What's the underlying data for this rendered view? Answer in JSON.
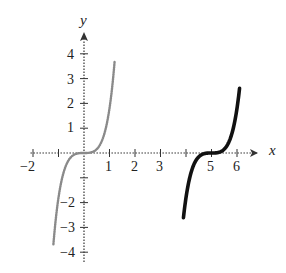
{
  "chart_data": {
    "type": "line",
    "title": "",
    "xlabel": "x",
    "ylabel": "y",
    "xlim": [
      -2.1,
      6.9
    ],
    "ylim": [
      -4.5,
      5.0
    ],
    "grid": false,
    "x_ticks": [
      -2,
      -1,
      1,
      2,
      3,
      4,
      5,
      6
    ],
    "x_tick_labels": [
      "-2",
      "",
      "1",
      "2",
      "3",
      "",
      "5",
      "6"
    ],
    "y_ticks": [
      4,
      3,
      2,
      1,
      -1,
      -2,
      -3,
      -4
    ],
    "y_tick_labels": [
      "4",
      "3",
      "2",
      "1",
      "",
      "-2",
      "-3",
      "-4"
    ],
    "series": [
      {
        "name": "parent cubic (gray dotted)",
        "style": "dotted",
        "color": "#8a8a8a",
        "center": [
          0,
          0
        ],
        "x_range": [
          -1.2,
          1.2
        ],
        "points": [
          [
            -1.2,
            -4.4
          ],
          [
            -1.0,
            -2.6
          ],
          [
            -0.8,
            -1.1
          ],
          [
            -0.6,
            -0.3
          ],
          [
            -0.3,
            -0.05
          ],
          [
            0,
            0
          ],
          [
            0.3,
            0.05
          ],
          [
            0.6,
            0.3
          ],
          [
            0.8,
            1.1
          ],
          [
            1.0,
            2.6
          ],
          [
            1.2,
            4.5
          ]
        ]
      },
      {
        "name": "translated cubic (black solid)",
        "style": "solid",
        "color": "#111111",
        "center": [
          5,
          0
        ],
        "x_range": [
          3.9,
          6.1
        ],
        "points": [
          [
            3.9,
            -4.3
          ],
          [
            4.0,
            -3.2
          ],
          [
            4.2,
            -1.3
          ],
          [
            4.4,
            -0.3
          ],
          [
            4.7,
            -0.05
          ],
          [
            5.0,
            0
          ],
          [
            5.3,
            0.05
          ],
          [
            5.6,
            0.3
          ],
          [
            5.8,
            1.3
          ],
          [
            6.0,
            3.2
          ],
          [
            6.1,
            4.5
          ]
        ]
      }
    ]
  },
  "labels": {
    "x_axis": "x",
    "y_axis": "y",
    "x_ticks": [
      {
        "text": "-2",
        "px": 32
      },
      {
        "text": "1",
        "px": 109
      },
      {
        "text": "2",
        "px": 135
      },
      {
        "text": "3",
        "px": 160
      },
      {
        "text": "5",
        "px": 211
      },
      {
        "text": "6",
        "px": 237
      }
    ],
    "y_ticks": [
      {
        "text": "4",
        "py": 55
      },
      {
        "text": "3",
        "py": 80
      },
      {
        "text": "2",
        "py": 104
      },
      {
        "text": "1",
        "py": 128
      },
      {
        "text": "-2",
        "py": 203
      },
      {
        "text": "-3",
        "py": 228
      },
      {
        "text": "-4",
        "py": 253
      }
    ]
  }
}
